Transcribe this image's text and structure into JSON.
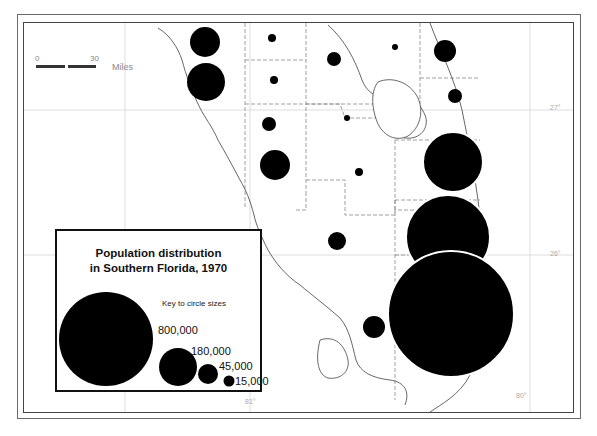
{
  "map": {
    "title_line1": "Population distribution",
    "title_line2": "in Southern Florida, 1970",
    "key_label": "Key to circle sizes",
    "scale_bar": {
      "start": "0",
      "end": "30",
      "unit": "Miles"
    },
    "graticule_labels": {
      "lat_27": "27°",
      "lat_26": "26°",
      "lon_81": "81°",
      "lon_80": "80°"
    },
    "fill_color": "#000000",
    "legend_circles": [
      {
        "value": "800,000",
        "label": "800,000"
      },
      {
        "value": "180,000",
        "label": "180,000"
      },
      {
        "value": "45,000",
        "label": "45,000"
      },
      {
        "value": "15,000",
        "label": "15,000"
      }
    ],
    "county_circles": [
      {
        "cx": 205,
        "cy": 42,
        "r": 15
      },
      {
        "cx": 206,
        "cy": 82,
        "r": 19
      },
      {
        "cx": 272,
        "cy": 38,
        "r": 4
      },
      {
        "cx": 274,
        "cy": 80,
        "r": 4
      },
      {
        "cx": 269,
        "cy": 124,
        "r": 7
      },
      {
        "cx": 275,
        "cy": 165,
        "r": 15
      },
      {
        "cx": 334,
        "cy": 59,
        "r": 7
      },
      {
        "cx": 347,
        "cy": 118,
        "r": 3
      },
      {
        "cx": 359,
        "cy": 172,
        "r": 4
      },
      {
        "cx": 337,
        "cy": 241,
        "r": 9
      },
      {
        "cx": 395,
        "cy": 47,
        "r": 3
      },
      {
        "cx": 445,
        "cy": 51,
        "r": 11
      },
      {
        "cx": 455,
        "cy": 96,
        "r": 7
      },
      {
        "cx": 453,
        "cy": 162,
        "r": 30
      },
      {
        "cx": 448,
        "cy": 237,
        "r": 42
      },
      {
        "cx": 451,
        "cy": 314,
        "r": 63
      },
      {
        "cx": 374,
        "cy": 327,
        "r": 11
      }
    ]
  }
}
